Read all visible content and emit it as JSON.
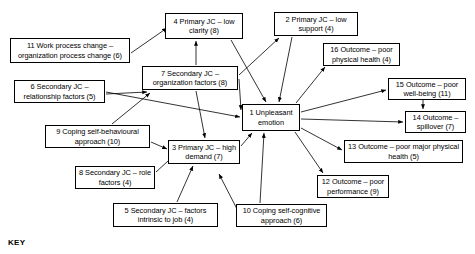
{
  "diagram": {
    "title": "",
    "key_label": "KEY",
    "nodes": [
      {
        "id": "n1",
        "label": "1 Unpleasant emotion",
        "number": 1,
        "count": null,
        "x": 242,
        "y": 104,
        "w": 58,
        "h": 27
      },
      {
        "id": "n2",
        "label": "2 Primary JC – low support (4)",
        "number": 2,
        "count": 4,
        "x": 274,
        "y": 12,
        "w": 84,
        "h": 24
      },
      {
        "id": "n3",
        "label": "3 Primary JC – high demand (7)",
        "number": 3,
        "count": 7,
        "x": 168,
        "y": 140,
        "w": 72,
        "h": 24
      },
      {
        "id": "n4",
        "label": "4 Primary JC – low clarity (8)",
        "number": 4,
        "count": 8,
        "x": 165,
        "y": 13,
        "w": 78,
        "h": 26
      },
      {
        "id": "n5",
        "label": "5 Secondary JC – factors intrinsic to job (4)",
        "number": 5,
        "count": 4,
        "x": 113,
        "y": 203,
        "w": 105,
        "h": 24
      },
      {
        "id": "n6",
        "label": "6 Secondary JC – relationship factors (5)",
        "number": 6,
        "count": 5,
        "x": 14,
        "y": 80,
        "w": 91,
        "h": 23
      },
      {
        "id": "n7",
        "label": "7 Secondary JC – organization factors (8)",
        "number": 7,
        "count": 8,
        "x": 142,
        "y": 66,
        "w": 96,
        "h": 24
      },
      {
        "id": "n8",
        "label": "8 Secondary JC – role factors (4)",
        "number": 8,
        "count": 4,
        "x": 75,
        "y": 166,
        "w": 80,
        "h": 23
      },
      {
        "id": "n9",
        "label": "9 Coping self-behavioural approach (10)",
        "number": 9,
        "count": 10,
        "x": 45,
        "y": 125,
        "w": 105,
        "h": 23
      },
      {
        "id": "n10",
        "label": "10 Coping self-cognitive approach (6)",
        "number": 10,
        "count": 6,
        "x": 236,
        "y": 204,
        "w": 91,
        "h": 23
      },
      {
        "id": "n11",
        "label": "11 Work process change – organization process change (6)",
        "number": 11,
        "count": 6,
        "x": 10,
        "y": 38,
        "w": 120,
        "h": 25
      },
      {
        "id": "n12",
        "label": "12 Outcome – poor performance (9)",
        "number": 12,
        "count": 9,
        "x": 317,
        "y": 175,
        "w": 72,
        "h": 23
      },
      {
        "id": "n13",
        "label": "13 Outcome – poor major physical health (5)",
        "number": 13,
        "count": 5,
        "x": 344,
        "y": 140,
        "w": 119,
        "h": 23
      },
      {
        "id": "n14",
        "label": "14 Outcome – spillover (7)",
        "number": 14,
        "count": 7,
        "x": 405,
        "y": 111,
        "w": 61,
        "h": 22
      },
      {
        "id": "n15",
        "label": "15 Outcome – poor well-being (11)",
        "number": 15,
        "count": 11,
        "x": 388,
        "y": 78,
        "w": 78,
        "h": 22
      },
      {
        "id": "n16",
        "label": "16 Outcome – poor physical health (4)",
        "number": 16,
        "count": 4,
        "x": 323,
        "y": 43,
        "w": 77,
        "h": 23
      }
    ],
    "edges": [
      {
        "from": "n11",
        "to": "n4",
        "x1": 131,
        "y1": 53,
        "x2": 167,
        "y2": 28
      },
      {
        "from": "n7",
        "to": "n4",
        "x1": 196,
        "y1": 65,
        "x2": 196,
        "y2": 41
      },
      {
        "from": "n7",
        "to": "n2",
        "x1": 239,
        "y1": 75,
        "x2": 279,
        "y2": 38
      },
      {
        "from": "n7",
        "to": "n1",
        "x1": 239,
        "y1": 79,
        "x2": 241,
        "y2": 110
      },
      {
        "from": "n7",
        "to": "n3",
        "x1": 196,
        "y1": 91,
        "x2": 205,
        "y2": 138
      },
      {
        "from": "n4",
        "to": "n1",
        "x1": 231,
        "y1": 40,
        "x2": 266,
        "y2": 102
      },
      {
        "from": "n2",
        "to": "n1",
        "x1": 292,
        "y1": 37,
        "x2": 279,
        "y2": 102
      },
      {
        "from": "n6",
        "to": "n7",
        "x1": 106,
        "y1": 94,
        "x2": 147,
        "y2": 92
      },
      {
        "from": "n6",
        "to": "n1",
        "x1": 106,
        "y1": 92,
        "x2": 240,
        "y2": 117
      },
      {
        "from": "n9",
        "to": "n7",
        "x1": 112,
        "y1": 124,
        "x2": 150,
        "y2": 93
      },
      {
        "from": "n9",
        "to": "n3",
        "x1": 151,
        "y1": 142,
        "x2": 167,
        "y2": 149
      },
      {
        "from": "n8",
        "to": "n3",
        "x1": 156,
        "y1": 172,
        "x2": 180,
        "y2": 150
      },
      {
        "from": "n5",
        "to": "n3",
        "x1": 177,
        "y1": 202,
        "x2": 193,
        "y2": 166
      },
      {
        "from": "n3",
        "to": "n1",
        "x1": 241,
        "y1": 146,
        "x2": 252,
        "y2": 133
      },
      {
        "from": "n10",
        "to": "n1",
        "x1": 260,
        "y1": 203,
        "x2": 264,
        "y2": 133
      },
      {
        "from": "n10",
        "to": "n6",
        "x1": 237,
        "y1": 209,
        "x2": 219,
        "y2": 174
      },
      {
        "from": "n1",
        "to": "n16",
        "x1": 296,
        "y1": 103,
        "x2": 325,
        "y2": 67
      },
      {
        "from": "n1",
        "to": "n15",
        "x1": 301,
        "y1": 112,
        "x2": 386,
        "y2": 90
      },
      {
        "from": "n1",
        "to": "n14",
        "x1": 301,
        "y1": 119,
        "x2": 403,
        "y2": 122
      },
      {
        "from": "n1",
        "to": "n13",
        "x1": 301,
        "y1": 128,
        "x2": 342,
        "y2": 150
      },
      {
        "from": "n1",
        "to": "n12",
        "x1": 295,
        "y1": 132,
        "x2": 323,
        "y2": 173
      },
      {
        "from": "n15",
        "to": "n14",
        "x1": 423,
        "y1": 100,
        "x2": 423,
        "y2": 109
      }
    ]
  }
}
